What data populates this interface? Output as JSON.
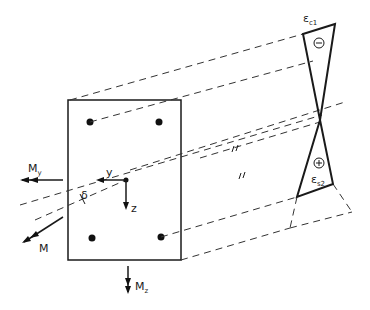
{
  "diagram": {
    "type": "reinforced-concrete-section-strain-distribution",
    "labels": {
      "moment_y": "M",
      "moment_y_sub": "y",
      "moment_z": "M",
      "moment_z_sub": "z",
      "moment_resultant": "M",
      "axis_y": "y",
      "axis_z": "z",
      "angle": "δ",
      "strain_top": "ε",
      "strain_top_sub": "c1",
      "strain_bottom": "ε",
      "strain_bottom_sub": "s2",
      "sign_compression": "⊖",
      "sign_tension": "⊕",
      "parallel_mark": "||"
    },
    "colors": {
      "line": "#1a1a1a",
      "background": "#ffffff"
    }
  }
}
